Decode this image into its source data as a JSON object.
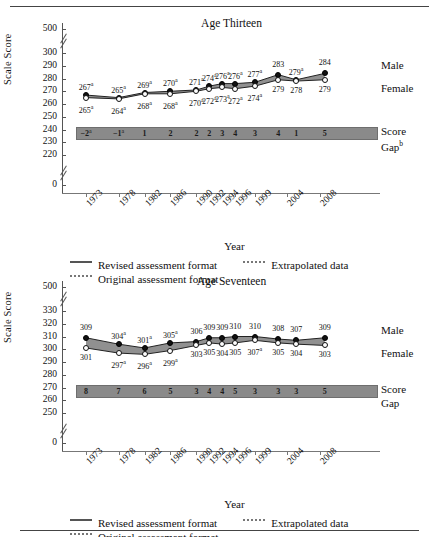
{
  "figure": {
    "legend": {
      "revised": "Revised assessment format",
      "original": "Original assessment format",
      "extrapolated": "Extrapolated data"
    },
    "axis_titles": {
      "y": "Scale Score",
      "x": "Year"
    },
    "series_labels": {
      "male": "Male",
      "female": "Female"
    },
    "gap_label_line1": "Score",
    "gap_label_line2": "Gap"
  },
  "chart_data": [
    {
      "type": "line",
      "title": "Age Thirteen",
      "xlabel": "Year",
      "ylabel": "Scale Score",
      "grid": false,
      "legend_position": "bottom",
      "axis_break": true,
      "categories": [
        "1973",
        "1978",
        "1982",
        "1986",
        "1990",
        "1992",
        "1994",
        "1996",
        "1999",
        "2004",
        "2004",
        "2008"
      ],
      "tick_labels": [
        "1973",
        "1978",
        "1982",
        "1986",
        "1990",
        "1992",
        "1994",
        "1996",
        "1999",
        "2004",
        "2008"
      ],
      "ytick_labels": [
        "500",
        "300",
        "290",
        "280",
        "270",
        "260",
        "250",
        "240",
        "230",
        "220",
        "0"
      ],
      "ylim": [
        220,
        300
      ],
      "series": [
        {
          "name": "Male",
          "values": [
            267,
            265,
            269,
            270,
            271,
            274,
            276,
            276,
            277,
            283,
            279,
            284
          ],
          "labels": [
            "267a",
            "265a",
            "269a",
            "270a",
            "271a",
            "274a",
            "276a",
            "276a",
            "277a",
            "283",
            "279a",
            "284"
          ]
        },
        {
          "name": "Female",
          "values": [
            265,
            264,
            268,
            268,
            270,
            272,
            273,
            272,
            274,
            279,
            278,
            279
          ],
          "labels": [
            "265a",
            "264a",
            "268a",
            "268a",
            "270a",
            "272a",
            "273a",
            "272a",
            "274a",
            "279",
            "278",
            "279"
          ]
        }
      ],
      "score_gap": {
        "label_line1": "Score",
        "label_line2": "Gap",
        "label_superscript": "b",
        "values": [
          "-2a",
          "-1a",
          "1",
          "2",
          "2",
          "2",
          "3",
          "4",
          "3",
          "4",
          "1",
          "5"
        ]
      }
    },
    {
      "type": "line",
      "title": "Age Seventeen",
      "xlabel": "Year",
      "ylabel": "Scale Score",
      "grid": false,
      "legend_position": "bottom",
      "axis_break": true,
      "categories": [
        "1973",
        "1978",
        "1982",
        "1986",
        "1990",
        "1992",
        "1994",
        "1996",
        "1999",
        "2004",
        "2004",
        "2008"
      ],
      "tick_labels": [
        "1973",
        "1978",
        "1982",
        "1986",
        "1990",
        "1992",
        "1994",
        "1996",
        "1999",
        "2004",
        "2008"
      ],
      "ytick_labels": [
        "500",
        "330",
        "320",
        "310",
        "300",
        "290",
        "280",
        "270",
        "260",
        "250",
        "0"
      ],
      "ylim": [
        250,
        330
      ],
      "series": [
        {
          "name": "Male",
          "values": [
            309,
            304,
            301,
            305,
            306,
            309,
            309,
            310,
            310,
            308,
            307,
            309
          ],
          "labels": [
            "309",
            "304a",
            "301a",
            "305a",
            "306",
            "309",
            "309",
            "310",
            "310",
            "308",
            "307",
            "309"
          ]
        },
        {
          "name": "Female",
          "values": [
            301,
            297,
            296,
            299,
            303,
            305,
            304,
            305,
            307,
            305,
            304,
            303
          ],
          "labels": [
            "301",
            "297a",
            "296a",
            "299a",
            "303",
            "305",
            "304",
            "305",
            "307a",
            "305",
            "304",
            "303"
          ]
        }
      ],
      "score_gap": {
        "label_line1": "Score",
        "label_line2": "Gap",
        "label_superscript": "",
        "values": [
          "8",
          "7",
          "6",
          "5",
          "3",
          "4",
          "4",
          "5",
          "3",
          "3",
          "3",
          "5"
        ]
      }
    }
  ]
}
